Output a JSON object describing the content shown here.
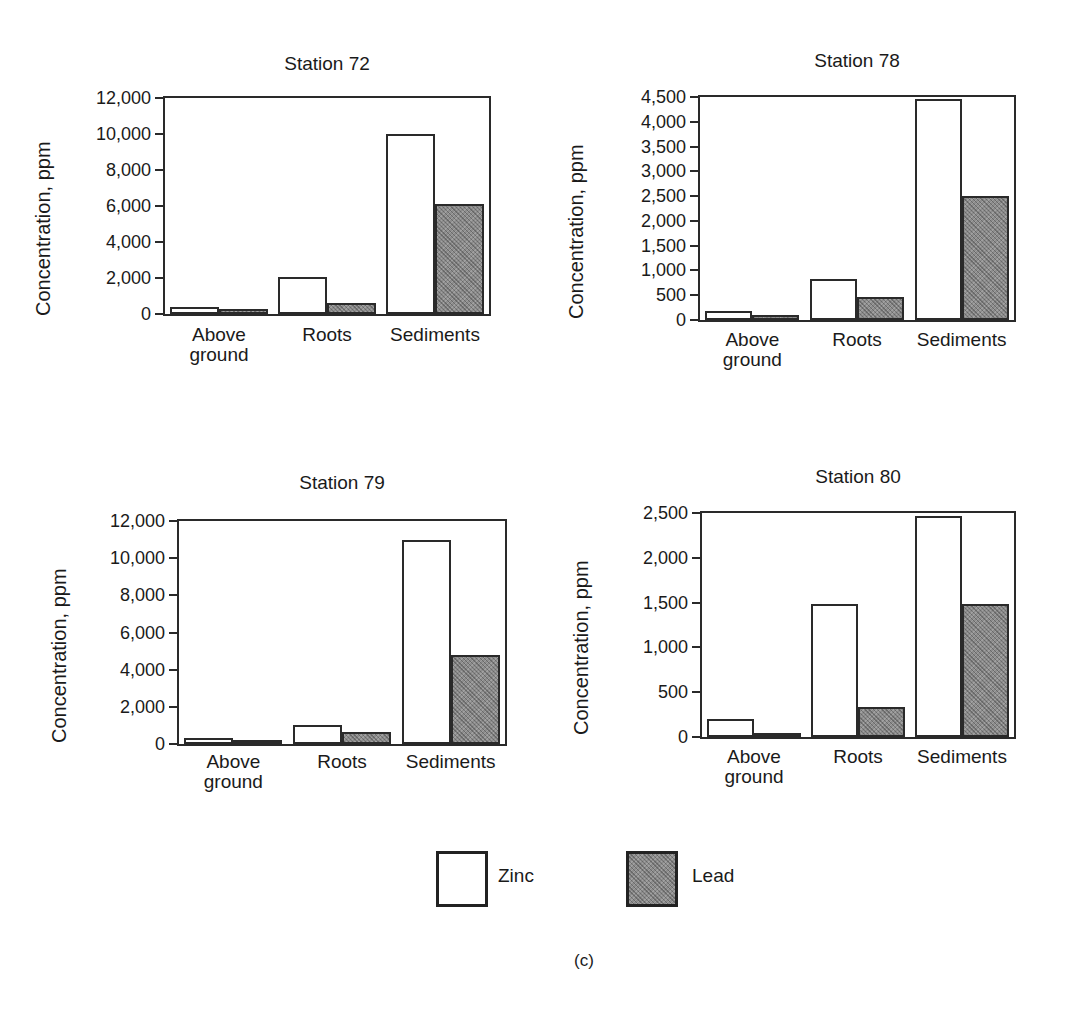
{
  "chart_data": [
    {
      "type": "bar",
      "title": "Station 72",
      "xlabel": "",
      "ylabel": "Concentration, ppm",
      "categories": [
        "Above ground",
        "Roots",
        "Sediments"
      ],
      "series": [
        {
          "name": "Zinc",
          "values": [
            400,
            2050,
            10000
          ]
        },
        {
          "name": "Lead",
          "values": [
            300,
            600,
            6100
          ]
        }
      ],
      "yticks": [
        "0",
        "2,000",
        "4,000",
        "6,000",
        "8,000",
        "10,000",
        "12,000"
      ],
      "ylim": [
        0,
        12000
      ],
      "grid": false
    },
    {
      "type": "bar",
      "title": "Station 78",
      "xlabel": "",
      "ylabel": "Concentration, ppm",
      "categories": [
        "Above ground",
        "Roots",
        "Sediments"
      ],
      "series": [
        {
          "name": "Zinc",
          "values": [
            180,
            820,
            4450
          ]
        },
        {
          "name": "Lead",
          "values": [
            100,
            460,
            2500
          ]
        }
      ],
      "yticks": [
        "0",
        "500",
        "1,000",
        "1,500",
        "2,000",
        "2,500",
        "3,000",
        "3,500",
        "4,000",
        "4,500"
      ],
      "ylim": [
        0,
        4500
      ],
      "grid": false
    },
    {
      "type": "bar",
      "title": "Station 79",
      "xlabel": "",
      "ylabel": "Concentration, ppm",
      "categories": [
        "Above ground",
        "Roots",
        "Sediments"
      ],
      "series": [
        {
          "name": "Zinc",
          "values": [
            350,
            1000,
            11000
          ]
        },
        {
          "name": "Lead",
          "values": [
            200,
            650,
            4800
          ]
        }
      ],
      "yticks": [
        "0",
        "2,000",
        "4,000",
        "6,000",
        "8,000",
        "10,000",
        "12,000"
      ],
      "ylim": [
        0,
        12000
      ],
      "grid": false
    },
    {
      "type": "bar",
      "title": "Station 80",
      "xlabel": "",
      "ylabel": "Concentration, ppm",
      "categories": [
        "Above ground",
        "Roots",
        "Sediments"
      ],
      "series": [
        {
          "name": "Zinc",
          "values": [
            200,
            1480,
            2470
          ]
        },
        {
          "name": "Lead",
          "values": [
            40,
            330,
            1480
          ]
        }
      ],
      "yticks": [
        "0",
        "500",
        "1,000",
        "1,500",
        "2,000",
        "2,500"
      ],
      "ylim": [
        0,
        2500
      ],
      "grid": false
    }
  ],
  "legend": {
    "position": "bottom-center",
    "items": [
      {
        "name": "Zinc",
        "fill": "#ffffff"
      },
      {
        "name": "Lead",
        "fill": "#8c8c8c"
      }
    ]
  },
  "caption": "(c)",
  "colors": {
    "zinc": "#ffffff",
    "lead": "#8c8c8c",
    "axis": "#2a2a2a"
  }
}
